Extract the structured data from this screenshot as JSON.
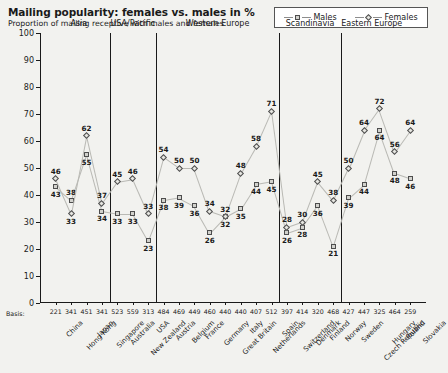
{
  "header": {
    "title": "Mailing popularity: females vs. males in %",
    "subtitle": "Proportion of mailing receptive with males and females"
  },
  "legend": {
    "males_label": "Males",
    "females_label": "Females",
    "males_marker": "square-marker-icon",
    "females_marker": "diamond-marker-icon"
  },
  "axis": {
    "basis_title": "Basis:",
    "y_ticks": [
      "0",
      "10",
      "20",
      "30",
      "40",
      "50",
      "60",
      "70",
      "80",
      "90",
      "100"
    ]
  },
  "groups": [
    {
      "label": "Asia",
      "count": 4
    },
    {
      "label": "USA/Pacific",
      "count": 3
    },
    {
      "label": "Western Europe",
      "count": 8
    },
    {
      "label": "Scandinavia",
      "count": 4
    },
    {
      "label": "Eastern Europe",
      "count": 4
    }
  ],
  "chart_data": {
    "type": "line",
    "title": "Mailing popularity: females vs. males in %",
    "subtitle": "Proportion of mailing receptive with males and females",
    "xlabel": "",
    "ylabel": "",
    "ylim": [
      0,
      100
    ],
    "ytick_step": 10,
    "grid": false,
    "legend_position": "top-right",
    "categories": [
      "China",
      "Hong Kong",
      "Japan",
      "Singapore",
      "Australia",
      "New Zealand",
      "USA",
      "Austria",
      "Belgium",
      "France",
      "Germany",
      "Great Britain",
      "Italy",
      "Netherlands",
      "Spain",
      "Switzerland",
      "Denmark",
      "Finland",
      "Norway",
      "Sweden",
      "Czech Republic",
      "Hungary",
      "Poland",
      "Slovakia"
    ],
    "basis": [
      "221",
      "341",
      "451",
      "341",
      "523",
      "559",
      "313",
      "484",
      "469",
      "449",
      "460",
      "440",
      "440",
      "407",
      "512",
      "397",
      "414",
      "320",
      "468",
      "427",
      "447",
      "325",
      "464",
      "259",
      "414"
    ],
    "series": [
      {
        "name": "Males",
        "marker": "square",
        "values": [
          43,
          38,
          55,
          34,
          33,
          33,
          23,
          38,
          39,
          36,
          26,
          32,
          35,
          44,
          45,
          26,
          28,
          36,
          21,
          39,
          44,
          64,
          48,
          46
        ]
      },
      {
        "name": "Females",
        "marker": "diamond",
        "values": [
          46,
          33,
          62,
          37,
          45,
          46,
          33,
          54,
          50,
          50,
          34,
          32,
          48,
          58,
          71,
          28,
          30,
          45,
          38,
          50,
          64,
          72,
          56,
          64
        ]
      }
    ]
  },
  "colors": {
    "background": "#f2f2ef",
    "line": "#b9b9b4",
    "marker_stroke": "#4d4d4d",
    "male_fill": "#d2d2cd",
    "female_fill": "#e6e6e1",
    "axis": "#1a1a1a"
  }
}
